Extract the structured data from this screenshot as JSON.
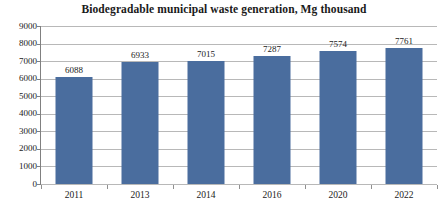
{
  "chart_data": {
    "type": "bar",
    "title": "Biodegradable municipal waste generation, Mg thousand",
    "xlabel": "",
    "ylabel": "",
    "categories": [
      "2011",
      "2013",
      "2014",
      "2016",
      "2020",
      "2022"
    ],
    "values": [
      6088,
      6933,
      7015,
      7287,
      7574,
      7761
    ],
    "data_labels": [
      "6088",
      "6933",
      "7015",
      "7287",
      "7574",
      "7761"
    ],
    "ylim": [
      0,
      9000
    ],
    "ytick_step": 1000,
    "ytick_labels": [
      "9000",
      "8000",
      "7000",
      "6000",
      "5000",
      "4000",
      "3000",
      "2000",
      "1000",
      "0"
    ],
    "ytick_values": [
      9000,
      8000,
      7000,
      6000,
      5000,
      4000,
      3000,
      2000,
      1000,
      0
    ],
    "grid": true,
    "grid_orientation": "horizontal",
    "legend": false,
    "legend_position": "none",
    "series": [
      {
        "name": "Biodegradable municipal waste generation",
        "values": [
          6088,
          6933,
          7015,
          7287,
          7574,
          7761
        ],
        "color": "#4a6d9e"
      }
    ],
    "colors": {
      "bar": "#4a6d9e",
      "gridline": "#b8b8b8",
      "axis": "#808080",
      "text": "#1a1a1a",
      "background": "#ffffff"
    }
  }
}
